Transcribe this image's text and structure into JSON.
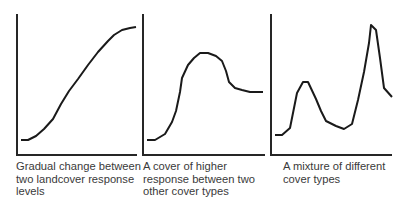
{
  "panels": [
    {
      "caption": "Gradual change between two landcover response levels",
      "axis": {
        "x0": 17,
        "y0": 14,
        "y1": 155,
        "x1": 137
      },
      "curve": [
        [
          21,
          140
        ],
        [
          28,
          140
        ],
        [
          36,
          136
        ],
        [
          44,
          129
        ],
        [
          53,
          119
        ],
        [
          61,
          104
        ],
        [
          69,
          91
        ],
        [
          78,
          79
        ],
        [
          88,
          65
        ],
        [
          98,
          52
        ],
        [
          108,
          41
        ],
        [
          114,
          35
        ],
        [
          122,
          30
        ],
        [
          130,
          28
        ],
        [
          136,
          27
        ]
      ]
    },
    {
      "caption": "A cover of higher response between two other cover types",
      "axis": {
        "x0": 143,
        "y0": 14,
        "y1": 155,
        "x1": 265
      },
      "curve": [
        [
          147,
          140
        ],
        [
          155,
          140
        ],
        [
          165,
          134
        ],
        [
          172,
          122
        ],
        [
          176,
          111
        ],
        [
          180,
          92
        ],
        [
          182,
          78
        ],
        [
          188,
          65
        ],
        [
          194,
          58
        ],
        [
          200,
          53
        ],
        [
          208,
          53
        ],
        [
          216,
          56
        ],
        [
          222,
          61
        ],
        [
          226,
          71
        ],
        [
          229,
          82
        ],
        [
          235,
          88
        ],
        [
          242,
          90
        ],
        [
          250,
          92
        ],
        [
          258,
          92
        ],
        [
          263,
          92
        ]
      ]
    },
    {
      "caption": "A mixture of different cover types",
      "axis": {
        "x0": 271,
        "y0": 14,
        "y1": 155,
        "x1": 392
      },
      "curve": [
        [
          275,
          135
        ],
        [
          282,
          135
        ],
        [
          290,
          128
        ],
        [
          297,
          93
        ],
        [
          303,
          82
        ],
        [
          308,
          82
        ],
        [
          316,
          99
        ],
        [
          321,
          111
        ],
        [
          326,
          121
        ],
        [
          336,
          126
        ],
        [
          344,
          129
        ],
        [
          352,
          124
        ],
        [
          358,
          100
        ],
        [
          364,
          72
        ],
        [
          369,
          43
        ],
        [
          371,
          25
        ],
        [
          376,
          30
        ],
        [
          380,
          58
        ],
        [
          384,
          88
        ],
        [
          392,
          97
        ]
      ]
    }
  ],
  "colors": {
    "line": "#1a1a1a",
    "axis": "#262626",
    "text": "#3a3a3a"
  }
}
